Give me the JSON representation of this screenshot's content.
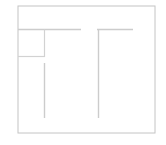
{
  "canvas": {
    "width": 166,
    "height": 145,
    "background_color": "#ffffff",
    "title": "Floor plan wireframe thumbnail"
  },
  "style": {
    "outer_border_color": "#c4c4c4",
    "outer_border_width": 1,
    "wall_color": "#cccccc",
    "wall_width": 1.4,
    "room_outline_color": "#d2d2d2",
    "room_outline_width": 1.2
  },
  "diagram": {
    "label": "floor-plan",
    "description": "Faint light-gray line drawing on a white ground: an outer rectangular boundary containing a small square room at upper left, a horizontal wall running right from the left boundary, a second horizontal wall at upper right, and two long vertical walls descending to form a corridor.",
    "outer_boundary": {
      "name": "outer-boundary",
      "x": 18,
      "y": 6,
      "width": 137,
      "height": 127
    },
    "walls": [
      {
        "name": "wall-top-left-horizontal",
        "orientation": "horizontal",
        "x1": 18,
        "y1": 29.5,
        "x2": 81,
        "y2": 29.5
      },
      {
        "name": "wall-top-right-horizontal",
        "orientation": "horizontal",
        "x1": 97,
        "y1": 29.5,
        "x2": 133,
        "y2": 29.5
      },
      {
        "name": "wall-room-right-vertical",
        "orientation": "vertical",
        "x1": 44.5,
        "y1": 29.5,
        "x2": 44.5,
        "y2": 57
      },
      {
        "name": "wall-room-bottom-horizontal",
        "orientation": "horizontal",
        "x1": 18,
        "y1": 56.5,
        "x2": 45,
        "y2": 56.5
      },
      {
        "name": "wall-corridor-left-vertical",
        "orientation": "vertical",
        "x1": 44.5,
        "y1": 63,
        "x2": 44.5,
        "y2": 118
      },
      {
        "name": "wall-corridor-right-vertical",
        "orientation": "vertical",
        "x1": 98.5,
        "y1": 29.5,
        "x2": 98.5,
        "y2": 118
      }
    ],
    "rooms": [
      {
        "name": "room-upper-left",
        "x": 18,
        "y": 30,
        "width": 27,
        "height": 27
      }
    ]
  }
}
